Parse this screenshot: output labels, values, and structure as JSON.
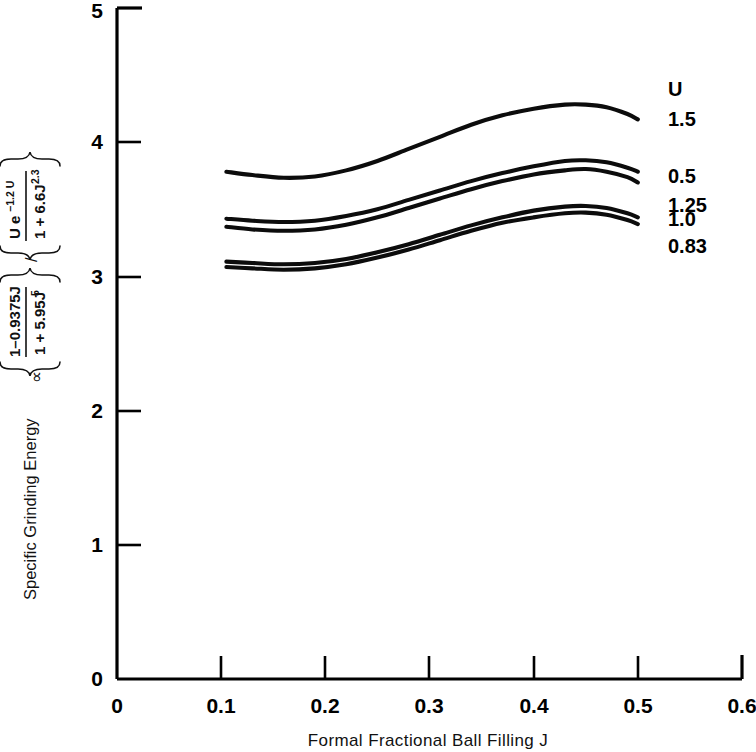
{
  "chart_data": {
    "type": "line",
    "title": "",
    "xlabel": "Formal Fractional Ball Filling J",
    "ylabel_plain": "Specific Grinding Energy ∝ { (1-0.9375J)/(1 + 5.95J⁵) } / { U e⁻¹·²ᵁ /(1 + 6.6J²·³) }",
    "ylabel_parts": {
      "lead": "Specific Grinding Energy",
      "prop_symbol": "∝",
      "num1": "1–0.9375J",
      "den1": "1 + 5.95J",
      "den1_sup": "5",
      "slash": "/",
      "num2_a": "U e",
      "num2_sup": "−1.2 U",
      "den2": "1 + 6.6J",
      "den2_sup": "2.3"
    },
    "xlim": [
      0,
      0.6
    ],
    "ylim": [
      0,
      5
    ],
    "xticks": [
      "0",
      "0.1",
      "0.2",
      "0.3",
      "0.4",
      "0.5",
      "0.6"
    ],
    "xtick_values": [
      0,
      0.1,
      0.2,
      0.3,
      0.4,
      0.5,
      0.6
    ],
    "yticks": [
      "0",
      "1",
      "2",
      "3",
      "4",
      "5"
    ],
    "ytick_values": [
      0,
      1,
      2,
      3,
      4,
      5
    ],
    "grid": false,
    "legend_position": "right",
    "legend_title": "U",
    "line_color": "#0c0c0c",
    "series": [
      {
        "name": "1.5",
        "x": [
          0.105,
          0.13,
          0.16,
          0.19,
          0.22,
          0.25,
          0.28,
          0.31,
          0.34,
          0.37,
          0.4,
          0.43,
          0.45,
          0.47,
          0.49,
          0.5
        ],
        "values": [
          3.78,
          3.755,
          3.735,
          3.745,
          3.79,
          3.86,
          3.95,
          4.04,
          4.13,
          4.2,
          4.25,
          4.28,
          4.28,
          4.26,
          4.21,
          4.17
        ]
      },
      {
        "name": "0.5",
        "x": [
          0.105,
          0.13,
          0.16,
          0.19,
          0.22,
          0.25,
          0.28,
          0.31,
          0.34,
          0.37,
          0.4,
          0.43,
          0.45,
          0.47,
          0.49,
          0.5
        ],
        "values": [
          3.43,
          3.415,
          3.405,
          3.415,
          3.45,
          3.5,
          3.57,
          3.64,
          3.71,
          3.77,
          3.82,
          3.86,
          3.865,
          3.85,
          3.81,
          3.78
        ]
      },
      {
        "name": "1.25",
        "x": [
          0.105,
          0.13,
          0.16,
          0.19,
          0.22,
          0.25,
          0.28,
          0.31,
          0.34,
          0.37,
          0.4,
          0.43,
          0.45,
          0.47,
          0.49,
          0.5
        ],
        "values": [
          3.37,
          3.35,
          3.34,
          3.35,
          3.385,
          3.44,
          3.51,
          3.58,
          3.65,
          3.71,
          3.76,
          3.79,
          3.8,
          3.78,
          3.74,
          3.7
        ]
      },
      {
        "name": "1.0",
        "x": [
          0.105,
          0.13,
          0.16,
          0.19,
          0.22,
          0.25,
          0.28,
          0.31,
          0.34,
          0.37,
          0.4,
          0.43,
          0.45,
          0.47,
          0.49,
          0.5
        ],
        "values": [
          3.11,
          3.1,
          3.09,
          3.1,
          3.13,
          3.18,
          3.24,
          3.31,
          3.38,
          3.44,
          3.49,
          3.52,
          3.525,
          3.51,
          3.47,
          3.44
        ]
      },
      {
        "name": "0.83",
        "x": [
          0.105,
          0.13,
          0.16,
          0.19,
          0.22,
          0.25,
          0.28,
          0.31,
          0.34,
          0.37,
          0.4,
          0.43,
          0.45,
          0.47,
          0.49,
          0.5
        ],
        "values": [
          3.07,
          3.06,
          3.05,
          3.06,
          3.09,
          3.14,
          3.2,
          3.27,
          3.34,
          3.4,
          3.44,
          3.47,
          3.475,
          3.46,
          3.42,
          3.39
        ]
      }
    ],
    "legend_entries": [
      {
        "label": "1.5",
        "y_at_end": 4.17
      },
      {
        "label": "0.5",
        "y_at_end": 3.78
      },
      {
        "label": "1.25",
        "y_at_end": 3.7
      },
      {
        "label": "1.0",
        "y_at_end": 3.44
      },
      {
        "label": "0.83",
        "y_at_end": 3.39
      }
    ]
  }
}
